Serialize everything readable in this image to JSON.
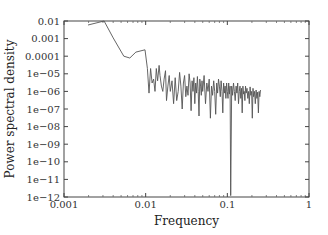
{
  "chart_data": {
    "type": "line",
    "title": "",
    "xlabel": "Frequency",
    "ylabel": "Power spectral density",
    "xscale": "log",
    "yscale": "log",
    "xlim": [
      0.001,
      1
    ],
    "ylim": [
      1e-12,
      0.01
    ],
    "grid": false,
    "legend": null,
    "x_ticks": [
      "0.001",
      "0.01",
      "0.1",
      "1"
    ],
    "x_tick_values": [
      0.001,
      0.01,
      0.1,
      1
    ],
    "y_ticks": [
      "0.01",
      "0.001",
      "0.0001",
      "1e−05",
      "1e−06",
      "1e−07",
      "1e−08",
      "1e−09",
      "1e−10",
      "1e−11",
      "1e−12"
    ],
    "y_tick_values": [
      0.01,
      0.001,
      0.0001,
      1e-05,
      1e-06,
      1e-07,
      1e-08,
      1e-09,
      1e-10,
      1e-11,
      1e-12
    ],
    "line_color": "#555555",
    "series": [
      {
        "name": "PSD",
        "x": [
          0.00197,
          0.0031,
          0.004,
          0.0054,
          0.0064,
          0.0076,
          0.0098,
          0.0105,
          0.011,
          0.0115,
          0.012,
          0.0125,
          0.013,
          0.0135,
          0.014,
          0.0146,
          0.015,
          0.0156,
          0.0162,
          0.0168,
          0.0175,
          0.018,
          0.0187,
          0.0194,
          0.02,
          0.021,
          0.022,
          0.023,
          0.024,
          0.025,
          0.026,
          0.027,
          0.028,
          0.029,
          0.03,
          0.031,
          0.032,
          0.033,
          0.034,
          0.035,
          0.036,
          0.037,
          0.038,
          0.039,
          0.04,
          0.041,
          0.042,
          0.043,
          0.044,
          0.045,
          0.046,
          0.047,
          0.048,
          0.049,
          0.05,
          0.052,
          0.054,
          0.056,
          0.058,
          0.06,
          0.062,
          0.064,
          0.066,
          0.068,
          0.07,
          0.072,
          0.074,
          0.076,
          0.078,
          0.08,
          0.082,
          0.084,
          0.086,
          0.088,
          0.09,
          0.092,
          0.094,
          0.096,
          0.098,
          0.1,
          0.102,
          0.104,
          0.106,
          0.108,
          0.11,
          0.113,
          0.116,
          0.119,
          0.122,
          0.125,
          0.128,
          0.131,
          0.134,
          0.137,
          0.14,
          0.143,
          0.146,
          0.149,
          0.152,
          0.155,
          0.158,
          0.161,
          0.164,
          0.167,
          0.17,
          0.174,
          0.178,
          0.182,
          0.186,
          0.19,
          0.194,
          0.198,
          0.202,
          0.206,
          0.21,
          0.215,
          0.22,
          0.225,
          0.23,
          0.235,
          0.24,
          0.245,
          0.25,
          0.255
        ],
        "y": [
          0.0059,
          0.01,
          0.0011,
          0.0001,
          7.9e-05,
          0.00017,
          0.00023,
          2e-05,
          8e-07,
          2e-05,
          3e-06,
          5e-06,
          1e-06,
          2e-05,
          4e-06,
          3e-05,
          8e-06,
          2e-06,
          1e-06,
          5e-06,
          1.5e-05,
          3e-07,
          2e-06,
          8e-06,
          1e-06,
          4e-06,
          2e-07,
          6e-06,
          3e-07,
          1e-06,
          1.2e-05,
          2e-06,
          1e-07,
          3e-06,
          8e-06,
          5e-07,
          2e-06,
          6e-07,
          1e-05,
          3e-06,
          8e-08,
          4e-06,
          1e-06,
          6e-06,
          2e-07,
          3e-06,
          8e-07,
          7e-06,
          1e-06,
          4e-08,
          5e-06,
          2e-06,
          6e-07,
          4e-06,
          1e-06,
          8e-06,
          2e-07,
          3e-06,
          1e-06,
          5e-06,
          3e-08,
          2e-06,
          6e-07,
          4e-06,
          1e-06,
          5e-08,
          3e-06,
          8e-07,
          5e-06,
          2e-06,
          5e-07,
          4e-06,
          1e-06,
          6e-08,
          3e-06,
          8e-07,
          2e-06,
          4e-07,
          3e-06,
          1e-06,
          4e-07,
          3e-06,
          7e-07,
          2e-06,
          1.2e-12,
          2e-06,
          6e-07,
          3e-06,
          1e-06,
          3e-07,
          2e-06,
          8e-07,
          3e-06,
          2e-07,
          1e-06,
          2e-06,
          4e-07,
          1.5e-06,
          6e-08,
          2e-06,
          7e-07,
          1e-06,
          3e-07,
          2e-06,
          8e-07,
          1.5e-06,
          4e-07,
          1e-06,
          2e-07,
          1.8e-06,
          6e-07,
          1e-06,
          3e-08,
          1.5e-06,
          5e-07,
          1e-06,
          2e-07,
          1.2e-06,
          4e-07,
          9e-07,
          6e-08,
          1e-06,
          5e-07,
          1.2e-06
        ]
      }
    ]
  }
}
